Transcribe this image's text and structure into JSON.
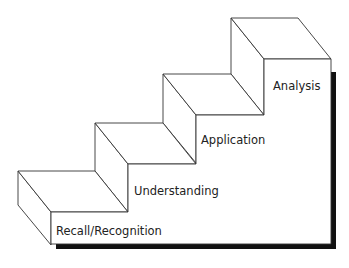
{
  "diagram": {
    "type": "staircase",
    "steps": [
      {
        "label": "Recall/Recognition",
        "level": 1
      },
      {
        "label": "Understanding",
        "level": 2
      },
      {
        "label": "Application",
        "level": 3
      },
      {
        "label": "Analysis",
        "level": 4
      }
    ],
    "colors": {
      "line": "#333333",
      "fill": "#ffffff",
      "shadow": "#111111"
    }
  }
}
